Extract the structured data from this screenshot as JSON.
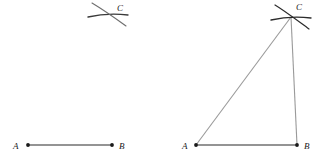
{
  "figure": {
    "background_color": "#ffffff",
    "width": 314,
    "height": 161,
    "ink_color": "#2b2b2b",
    "line_color": "#8c8c8c",
    "arc_color": "#3a3a3a",
    "panels": [
      {
        "name": "step-1-arcs-only",
        "labels": {
          "a": "A",
          "b": "B",
          "c": "C"
        },
        "points": {
          "a": {
            "x": 28,
            "y": 145
          },
          "b": {
            "x": 112,
            "y": 145
          },
          "c": {
            "x": 108,
            "y": 14
          }
        },
        "label_positions": {
          "a": {
            "x": 13,
            "y": 149
          },
          "b": {
            "x": 119,
            "y": 149
          },
          "c": {
            "x": 117,
            "y": 11
          }
        },
        "segments": [
          {
            "name": "segment-ab",
            "x1": 28,
            "y1": 145,
            "x2": 112,
            "y2": 145
          }
        ],
        "arcs": [
          {
            "name": "arc-from-a",
            "d": "M 88 17 C 99 14.5 114 13.5 128 15"
          },
          {
            "name": "arc-from-b",
            "d": "M 92 3 C 102 9 115 18 126 26"
          }
        ]
      },
      {
        "name": "step-2-triangle-complete",
        "labels": {
          "a": "A",
          "b": "B",
          "c": "C"
        },
        "points": {
          "a": {
            "x": 196,
            "y": 145
          },
          "b": {
            "x": 297,
            "y": 145
          },
          "c": {
            "x": 291,
            "y": 17
          }
        },
        "label_positions": {
          "a": {
            "x": 182,
            "y": 149
          },
          "b": {
            "x": 304,
            "y": 149
          },
          "c": {
            "x": 296,
            "y": 10
          }
        },
        "segments": [
          {
            "name": "segment-ab",
            "x1": 196,
            "y1": 145,
            "x2": 297,
            "y2": 145
          },
          {
            "name": "segment-ac",
            "x1": 196,
            "y1": 145,
            "x2": 291,
            "y2": 17
          },
          {
            "name": "segment-bc",
            "x1": 297,
            "y1": 145,
            "x2": 291,
            "y2": 17
          }
        ],
        "arcs": [
          {
            "name": "arc-from-a",
            "d": "M 271 20 C 282 17.5 297 16.5 311 18"
          },
          {
            "name": "arc-from-b",
            "d": "M 275 5 C 285 11 298 21 309 29"
          }
        ]
      }
    ]
  }
}
